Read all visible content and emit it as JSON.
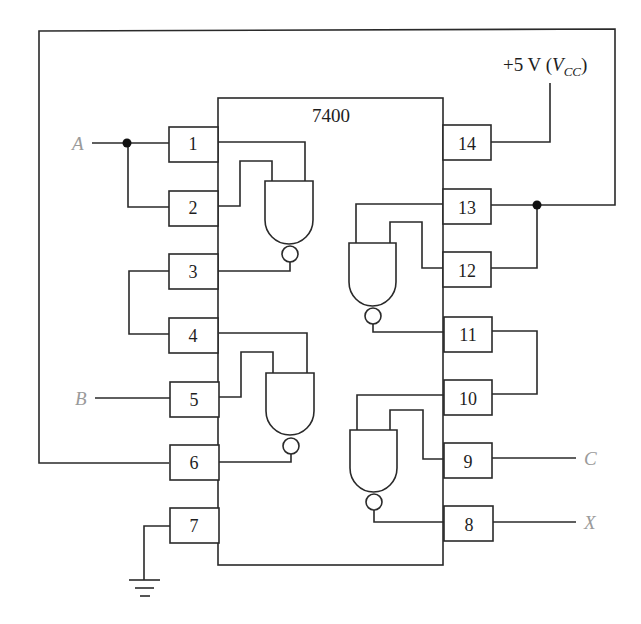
{
  "chip": {
    "label": "7400",
    "description": "Quad 2-input NAND gate IC"
  },
  "pins_left": [
    {
      "num": "1",
      "y": 143
    },
    {
      "num": "2",
      "y": 207
    },
    {
      "num": "3",
      "y": 271
    },
    {
      "num": "4",
      "y": 334
    },
    {
      "num": "5",
      "y": 399
    },
    {
      "num": "6",
      "y": 463
    },
    {
      "num": "7",
      "y": 526
    }
  ],
  "pins_right": [
    {
      "num": "14",
      "y": 143
    },
    {
      "num": "13",
      "y": 207
    },
    {
      "num": "12",
      "y": 271
    },
    {
      "num": "11",
      "y": 334
    },
    {
      "num": "10",
      "y": 398
    },
    {
      "num": "9",
      "y": 462
    },
    {
      "num": "8",
      "y": 526
    }
  ],
  "signals": {
    "A": "A",
    "B": "B",
    "C": "C",
    "X": "X"
  },
  "power": {
    "label_prefix": "+5 V (",
    "label_v": "V",
    "label_sub": "CC",
    "label_suffix": ")"
  },
  "ground": {
    "label": "ground"
  },
  "colors": {
    "line": "#2a2a2a",
    "signal_label": "#9a9a9a",
    "text": "#1e1e1e"
  }
}
